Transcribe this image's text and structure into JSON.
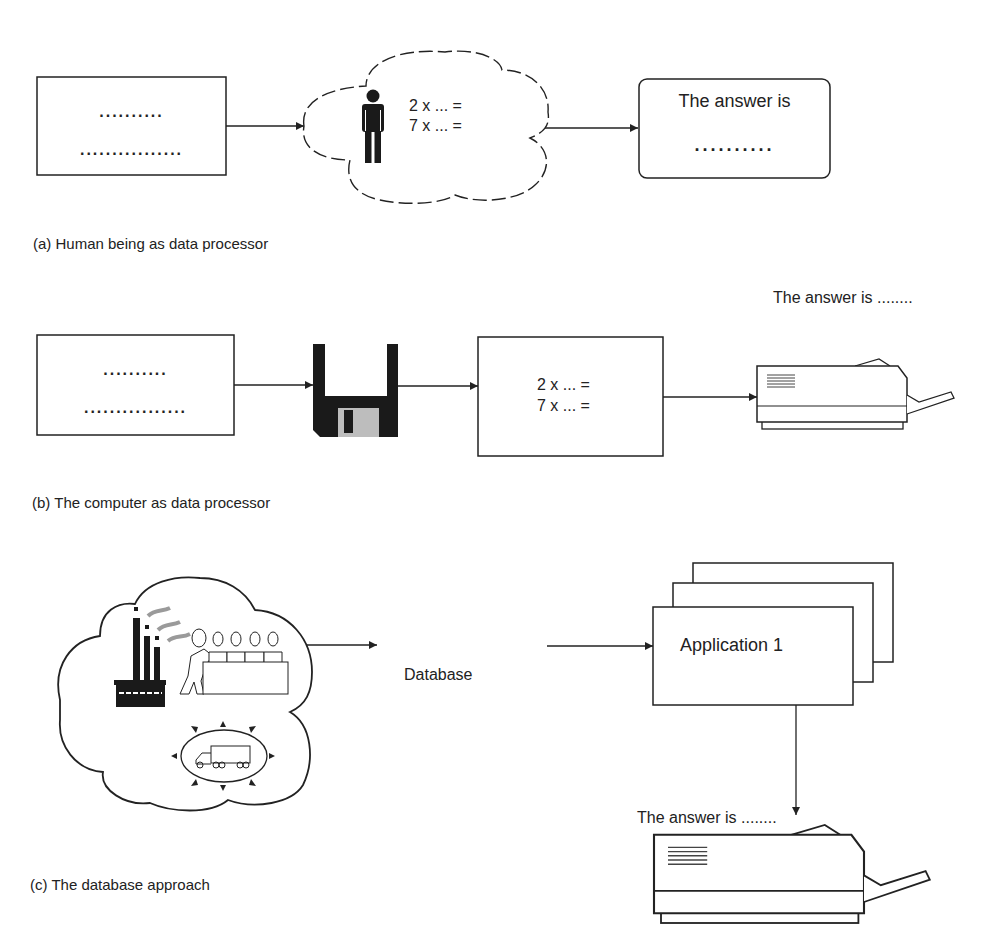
{
  "colors": {
    "stroke": "#222222",
    "fill_dark": "#1a1a1a",
    "fill_grey": "#bdbdbd",
    "smoke": "#9a9a9a",
    "background": "#ffffff"
  },
  "panel_a": {
    "caption": "(a) Human being as data processor",
    "input_box": {
      "line1": "..........",
      "line2": "................"
    },
    "cloud": {
      "icon": "person-icon",
      "line1": "2 x ... =",
      "line2": "7 x ... ="
    },
    "output_box": {
      "title": "The answer is",
      "dots": ".........."
    }
  },
  "panel_b": {
    "caption": "(b) The computer as data processor",
    "input_box": {
      "line1": "..........",
      "line2": "................"
    },
    "storage_icon": "floppy-disk-icon",
    "processor_box": {
      "line1": "2 x ... =",
      "line2": "7 x ... ="
    },
    "printer_icon": "printer-icon",
    "printer_label": "The answer is ........"
  },
  "panel_c": {
    "caption": "(c) The database approach",
    "cloud_icons": [
      "factory-icon",
      "people-at-table-icon",
      "truck-icon"
    ],
    "database_label": "Database",
    "applications": {
      "front_label": "Application 1",
      "stack_count": 3
    },
    "printer_icon": "printer-icon",
    "printer_label": "The answer is ........"
  }
}
